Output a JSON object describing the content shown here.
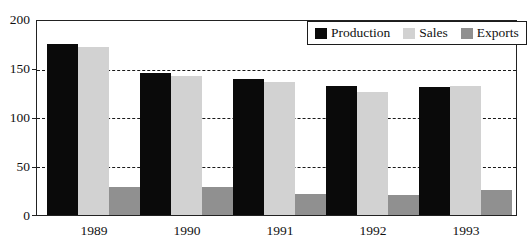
{
  "chart_data": {
    "type": "bar",
    "title": "",
    "subtitle": "",
    "xlabel": "",
    "ylabel": "",
    "categories": [
      "1989",
      "1990",
      "1991",
      "1992",
      "1993"
    ],
    "series": [
      {
        "name": "Production",
        "color": "#0a0a0a",
        "values": [
          176,
          146,
          140,
          133,
          132
        ]
      },
      {
        "name": "Sales",
        "color": "#d2d2d2",
        "values": [
          173,
          143,
          137,
          127,
          133
        ]
      },
      {
        "name": "Exports",
        "color": "#909090",
        "values": [
          29,
          29,
          22,
          21,
          26
        ]
      }
    ],
    "ylim": [
      0,
      200
    ],
    "yticks": [
      0,
      50,
      100,
      150,
      200
    ],
    "ytick_labels": [
      "0",
      "50",
      "100",
      "150",
      "200"
    ],
    "grid": true,
    "grid_axis": "y",
    "grid_style": "dashed",
    "legend": true,
    "legend_position": "top-right"
  },
  "legend": {
    "items": [
      {
        "label": "Production",
        "swatch": "production-swatch"
      },
      {
        "label": "Sales",
        "swatch": "sales-swatch"
      },
      {
        "label": "Exports",
        "swatch": "exports-swatch"
      }
    ]
  },
  "axes": {
    "y_tick_labels": [
      "200",
      "150",
      "100",
      "50",
      "0"
    ],
    "x_tick_labels": [
      "1989",
      "1990",
      "1991",
      "1992",
      "1993"
    ]
  }
}
